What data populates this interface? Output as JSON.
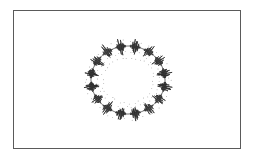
{
  "figure": {
    "type": "circular-waveform-diagram",
    "frame": {
      "x": 13,
      "y": 10,
      "width": 228,
      "height": 139,
      "border_color": "#5a5a5a"
    },
    "ring": {
      "center": [
        128,
        80
      ],
      "radius_x": 37,
      "radius_y": 34,
      "burst_count": 16,
      "burst_amplitude": 8,
      "stroke_color": "#222222",
      "dot_color": "#7a7a7a",
      "inner_dot_rings": [
        {
          "rx": 31,
          "ry": 28,
          "count": 40
        },
        {
          "rx": 26,
          "ry": 23,
          "count": 34
        },
        {
          "rx": 42,
          "ry": 39,
          "count": 44
        }
      ]
    }
  }
}
